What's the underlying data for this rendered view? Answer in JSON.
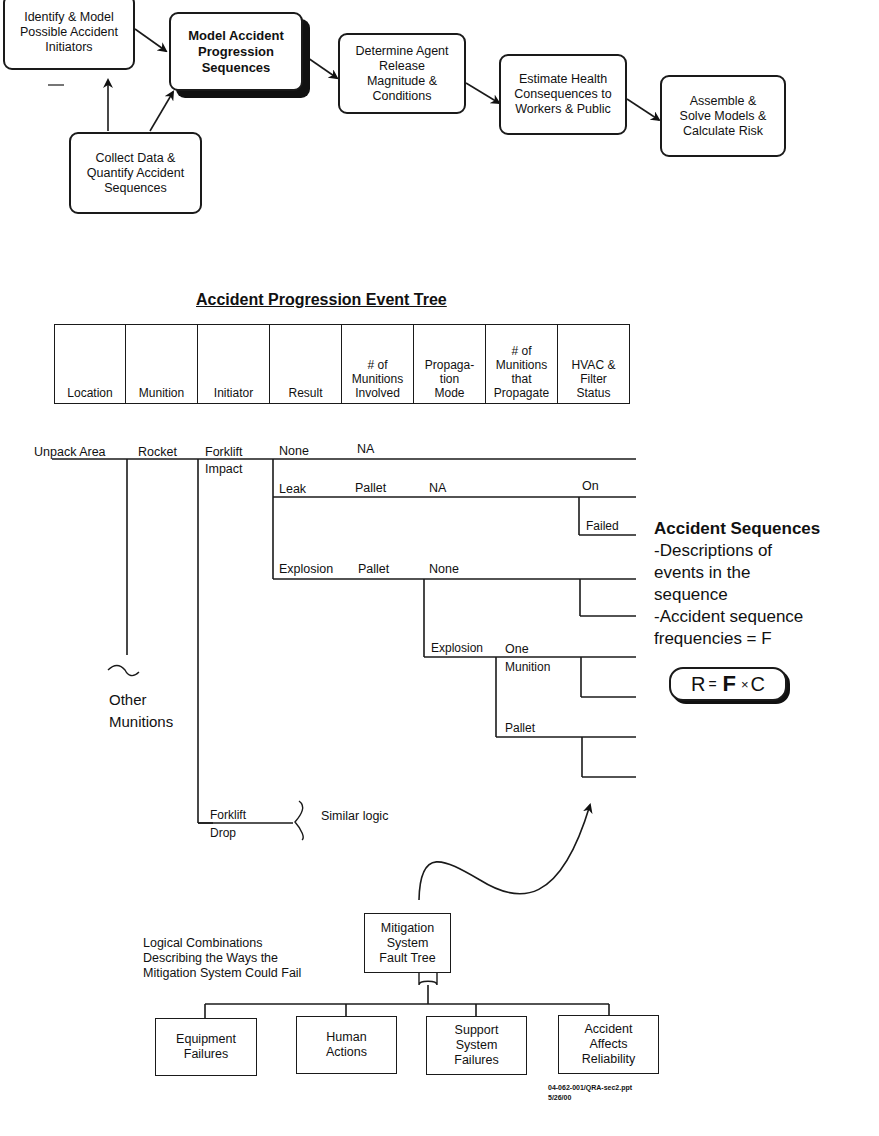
{
  "process_flow": {
    "steps": [
      {
        "id": "identify",
        "label_lines": [
          "Identify & Model",
          "Possible Accident",
          "Initiators"
        ]
      },
      {
        "id": "model",
        "label_lines": [
          "Model Accident",
          "Progression",
          "Sequences"
        ],
        "emphasized": true
      },
      {
        "id": "determine",
        "label_lines": [
          "Determine Agent",
          "Release",
          "Magnitude &",
          "Conditions"
        ]
      },
      {
        "id": "estimate",
        "label_lines": [
          "Estimate Health",
          "Consequences to",
          "Workers & Public"
        ]
      },
      {
        "id": "assemble",
        "label_lines": [
          "Assemble &",
          "Solve Models &",
          "Calculate Risk"
        ]
      },
      {
        "id": "collect",
        "label_lines": [
          "Collect Data &",
          "Quantify Accident",
          "Sequences"
        ]
      }
    ]
  },
  "event_tree": {
    "title": "Accident Progression Event Tree",
    "headers": [
      [
        "Location"
      ],
      [
        "Munition"
      ],
      [
        "Initiator"
      ],
      [
        "Result"
      ],
      [
        "# of",
        "Munitions",
        "Involved"
      ],
      [
        "Propaga-",
        "tion",
        "Mode"
      ],
      [
        "# of",
        "Munitions",
        "that",
        "Propagate"
      ],
      [
        "HVAC &",
        "Filter",
        "Status"
      ]
    ],
    "labels": {
      "location": "Unpack Area",
      "munition": "Rocket",
      "initiator_1a": "Forklift",
      "initiator_1b": "Impact",
      "result_none": "None",
      "na_1": "NA",
      "result_leak": "Leak",
      "leak_involved": "Pallet",
      "leak_mode": "NA",
      "hvac_on": "On",
      "hvac_failed": "Failed",
      "result_explosion": "Explosion",
      "expl_involved": "Pallet",
      "expl_mode_none": "None",
      "expl_mode_explosion": "Explosion",
      "propagate_one_a": "One",
      "propagate_one_b": "Munition",
      "propagate_pallet": "Pallet",
      "other_munitions_a": "Other",
      "other_munitions_b": "Munitions",
      "initiator_2a": "Forklift",
      "initiator_2b": "Drop",
      "similar_logic": "Similar logic"
    }
  },
  "accident_sequences": {
    "heading": "Accident Sequences",
    "lines": [
      "-Descriptions of",
      "events in the",
      "sequence",
      "-Accident sequence",
      "frequencies = F"
    ],
    "formula": {
      "r": "R",
      "eq": "=",
      "f": "F",
      "times": "×",
      "c": "C"
    }
  },
  "fault_tree": {
    "top": [
      "Mitigation",
      "System",
      "Fault Tree"
    ],
    "caption": [
      "Logical Combinations",
      "Describing the Ways the",
      "Mitigation System Could Fail"
    ],
    "children": [
      [
        "Equipment",
        "Failures"
      ],
      [
        "Human",
        "Actions"
      ],
      [
        "Support",
        "System",
        "Failures"
      ],
      [
        "Accident",
        "Affects",
        "Reliability"
      ]
    ]
  },
  "footer": {
    "file": "04-062-001/QRA-sec2.ppt",
    "date": "5/26/00"
  }
}
